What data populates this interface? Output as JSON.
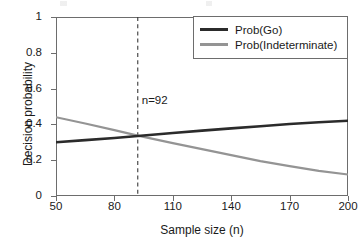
{
  "chart_data": {
    "type": "line",
    "title": "",
    "xlabel": "Sample size (n)",
    "ylabel": "Decision probability",
    "xlim": [
      50,
      200
    ],
    "ylim": [
      0,
      1
    ],
    "xticks": [
      50,
      80,
      110,
      140,
      170,
      200
    ],
    "yticks": [
      0,
      0.2,
      0.4,
      0.6,
      0.8,
      1
    ],
    "xtick_labels": [
      "50",
      "80",
      "110",
      "140",
      "170",
      "200"
    ],
    "ytick_labels": [
      "0",
      "0.2",
      "0.4",
      "0.6",
      "0.8",
      "1"
    ],
    "grid": false,
    "legend_position": "top-right",
    "series": [
      {
        "name": "Prob(Go)",
        "color": "#2b2b2b",
        "x": [
          50,
          65,
          80,
          92,
          110,
          125,
          140,
          155,
          170,
          185,
          200
        ],
        "values": [
          0.3,
          0.312,
          0.324,
          0.335,
          0.352,
          0.365,
          0.378,
          0.39,
          0.402,
          0.412,
          0.42
        ]
      },
      {
        "name": "Prob(Indeterminate)",
        "color": "#949494",
        "x": [
          50,
          65,
          80,
          92,
          110,
          125,
          140,
          155,
          170,
          185,
          200
        ],
        "values": [
          0.44,
          0.405,
          0.368,
          0.337,
          0.295,
          0.262,
          0.228,
          0.195,
          0.167,
          0.14,
          0.12
        ]
      }
    ],
    "annotations": [
      {
        "label": "n=92",
        "x": 92,
        "y": 0.535,
        "type": "vertical-dashed-line",
        "line_color": "#3a3a3a",
        "line_style": "dashed"
      }
    ]
  },
  "legend": {
    "entries": [
      {
        "label": "Prob(Go)",
        "swatch": "solid-dark-line"
      },
      {
        "label": "Prob(Indeterminate)",
        "swatch": "solid-gray-line"
      }
    ]
  },
  "axes": {
    "x_title": "Sample size (n)",
    "y_title": "Decision probability"
  },
  "colors": {
    "go_line": "#2b2b2b",
    "indeterminate_line": "#949494",
    "axis": "#6d6d6d",
    "annotation_line": "#3a3a3a",
    "background": "#ffffff"
  }
}
